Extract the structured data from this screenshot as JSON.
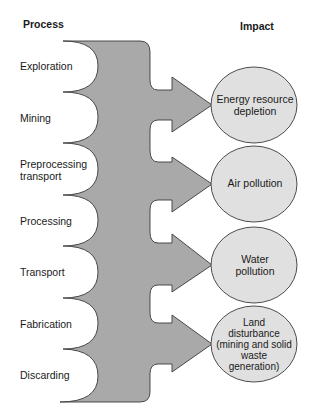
{
  "headers": {
    "process": "Process",
    "impact": "Impact"
  },
  "colors": {
    "flow_fill": "#a9a9a9",
    "ellipse_fill": "#e0e0e0",
    "stroke": "#3a3a3a"
  },
  "processes": [
    {
      "label": "Exploration",
      "y": 60
    },
    {
      "label": "Mining",
      "y": 112
    },
    {
      "label": "Preprocessing\ntransport",
      "y": 158
    },
    {
      "label": "Processing",
      "y": 215
    },
    {
      "label": "Transport",
      "y": 266
    },
    {
      "label": "Fabrication",
      "y": 318
    },
    {
      "label": "Discarding",
      "y": 369
    }
  ],
  "impacts": [
    {
      "label": "Energy resource\ndepletion",
      "cx": 254,
      "cy": 105
    },
    {
      "label": "Air pollution",
      "cx": 254,
      "cy": 184
    },
    {
      "label": "Water\npollution",
      "cx": 254,
      "cy": 265
    },
    {
      "label": "Land\ndisturbance\n(mining and solid\nwaste\ngeneration)",
      "cx": 254,
      "cy": 344
    }
  ]
}
